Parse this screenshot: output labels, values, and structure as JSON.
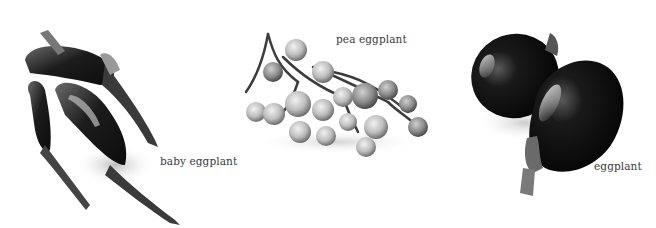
{
  "figure": {
    "items": [
      {
        "name": "baby-eggplant",
        "label": "baby eggplant"
      },
      {
        "name": "pea-eggplant",
        "label": "pea eggplant"
      },
      {
        "name": "eggplant",
        "label": "eggplant"
      }
    ]
  }
}
